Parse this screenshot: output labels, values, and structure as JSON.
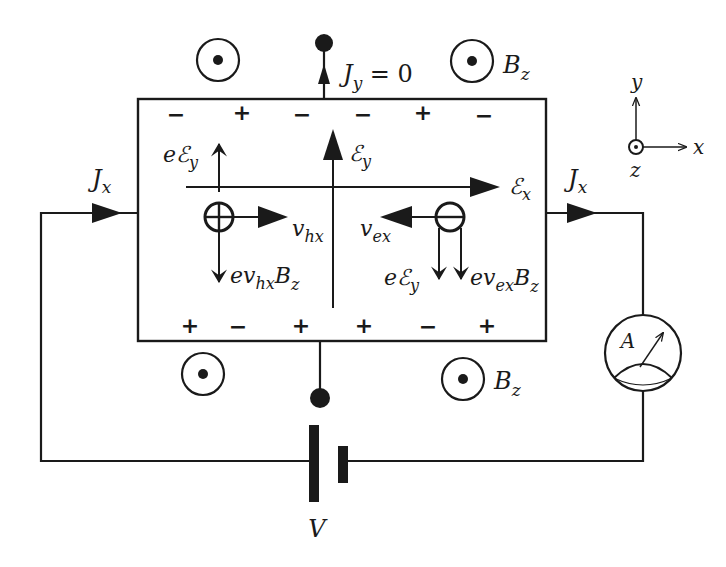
{
  "diagram": {
    "colors": {
      "ink": "#1a1a1a",
      "background": "#ffffff"
    },
    "labels": {
      "jy_main": "J",
      "jy_sub": "y",
      "jy_eq": " = 0",
      "bz_top": "B",
      "bz_top_sub": "z",
      "bz_bottom": "B",
      "bz_bottom_sub": "z",
      "jx_left": "J",
      "jx_left_sub": "x",
      "jx_right": "J",
      "jx_right_sub": "x",
      "ey_field": "ℰ",
      "ey_field_sub": "y",
      "ex_field": "ℰ",
      "ex_field_sub": "x",
      "hole_force_e": "eℰ",
      "hole_force_e_sub": "y",
      "hole_velocity": "v",
      "hole_velocity_sub": "hx",
      "hole_magnetic_force": "ev",
      "hole_magnetic_force_sub": "hx",
      "hole_magnetic_force_b": "B",
      "hole_magnetic_force_b_sub": "z",
      "electron_velocity": "v",
      "electron_velocity_sub": "ex",
      "electron_force_e": "eℰ",
      "electron_force_e_sub": "y",
      "electron_magnetic_force": "ev",
      "electron_magnetic_force_sub": "ex",
      "electron_magnetic_force_b": "B",
      "electron_magnetic_force_b_sub": "z",
      "battery": "V",
      "ammeter": "A",
      "axis_x": "x",
      "axis_y": "y",
      "axis_z": "z"
    },
    "top_edge_charges": [
      "−",
      "+",
      "−",
      "−",
      "+",
      "−"
    ],
    "bottom_edge_charges": [
      "+",
      "−",
      "+",
      "+",
      "−",
      "+"
    ],
    "carriers": [
      {
        "type": "hole",
        "symbol": "⊕"
      },
      {
        "type": "electron",
        "symbol": "⊖"
      }
    ],
    "magnetic_field_symbols": [
      "out-of-page",
      "out-of-page",
      "out-of-page",
      "out-of-page"
    ]
  }
}
